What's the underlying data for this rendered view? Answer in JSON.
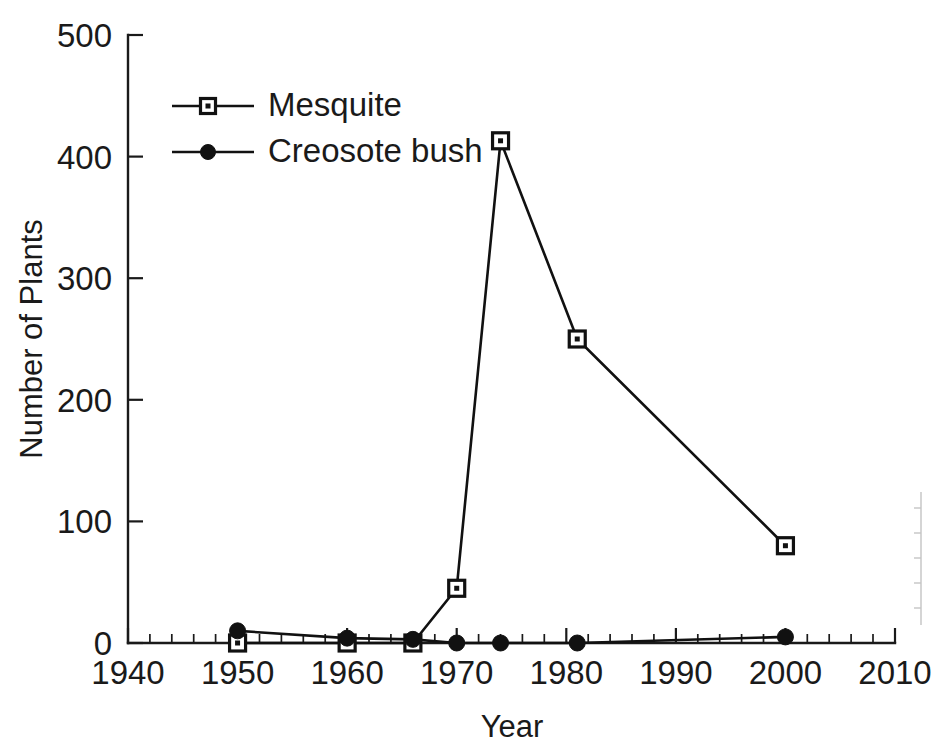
{
  "chart_data": {
    "type": "line",
    "title": "",
    "subtitle": "",
    "xlabel": "Year",
    "ylabel": "Number of Plants",
    "xlim": [
      1940,
      2010
    ],
    "ylim": [
      0,
      500
    ],
    "xticks": [
      1940,
      1950,
      1960,
      1970,
      1980,
      1990,
      2000,
      2010
    ],
    "yticks": [
      0,
      100,
      200,
      300,
      400,
      500
    ],
    "xtick_labels": [
      "1940",
      "1950",
      "1960",
      "1970",
      "1980",
      "1990",
      "2000",
      "2010"
    ],
    "ytick_labels": [
      "0",
      "100",
      "200",
      "300",
      "400",
      "500"
    ],
    "x_minor_tick_interval": 2,
    "grid": false,
    "legend_position": "upper-left-inside",
    "series": [
      {
        "name": "Mesquite",
        "marker": "open-square",
        "x": [
          1950,
          1960,
          1966,
          1970,
          1974,
          1981,
          2000
        ],
        "values": [
          0,
          0,
          0,
          45,
          413,
          250,
          80
        ]
      },
      {
        "name": "Creosote bush",
        "marker": "filled-circle",
        "x": [
          1950,
          1960,
          1966,
          1970,
          1974,
          1981,
          2000
        ],
        "values": [
          10,
          4,
          3,
          0,
          0,
          0,
          5
        ]
      }
    ]
  },
  "legend": {
    "entries": [
      {
        "label": "Mesquite",
        "marker": "open-square"
      },
      {
        "label": "Creosote bush",
        "marker": "filled-circle"
      }
    ]
  },
  "colors": {
    "ink": "#111111",
    "background": "#ffffff",
    "edge_artifact": "#b9b9b9"
  }
}
